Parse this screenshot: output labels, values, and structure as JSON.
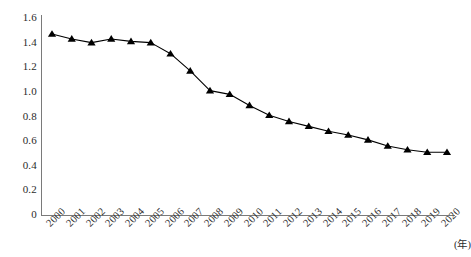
{
  "chart_data": {
    "type": "line",
    "title": "",
    "subtitle": "",
    "xlabel": "(年)",
    "ylabel": "",
    "categories": [
      "2000",
      "2001",
      "2002",
      "2003",
      "2004",
      "2005",
      "2006",
      "2007",
      "2008",
      "2009",
      "2010",
      "2011",
      "2012",
      "2013",
      "2014",
      "2015",
      "2016",
      "2017",
      "2018",
      "2019",
      "2020"
    ],
    "values": [
      1.47,
      1.43,
      1.4,
      1.43,
      1.41,
      1.4,
      1.31,
      1.17,
      1.01,
      0.98,
      0.89,
      0.81,
      0.76,
      0.72,
      0.68,
      0.65,
      0.61,
      0.56,
      0.53,
      0.51,
      0.51
    ],
    "series": [
      {
        "name": "",
        "values": [
          1.47,
          1.43,
          1.4,
          1.43,
          1.41,
          1.4,
          1.31,
          1.17,
          1.01,
          0.98,
          0.89,
          0.81,
          0.76,
          0.72,
          0.68,
          0.65,
          0.61,
          0.56,
          0.53,
          0.51,
          0.51
        ],
        "marker": "triangle-up",
        "color": "#000000"
      }
    ],
    "ylim": [
      0,
      1.6
    ],
    "yticks": [
      0,
      0.2,
      0.4,
      0.6,
      0.8,
      1.0,
      1.2,
      1.4,
      1.6
    ],
    "ytick_labels": [
      "0",
      "0.2",
      "0.4",
      "0.6",
      "0.8",
      "1.0",
      "1.2",
      "1.4",
      "1.6"
    ],
    "xtick_labels": [
      "2000",
      "2001",
      "2002",
      "2003",
      "2004",
      "2005",
      "2006",
      "2007",
      "2008",
      "2009",
      "2010",
      "2011",
      "2012",
      "2013",
      "2014",
      "2015",
      "2016",
      "2017",
      "2018",
      "2019",
      "2020"
    ],
    "xtick_rotation": -45,
    "grid": false,
    "legend": false,
    "legend_position": "none",
    "annotations": []
  },
  "axis": {
    "unit_label": "(年)",
    "line_color": "#7a7a7a",
    "text_color": "#2b2b2b"
  }
}
